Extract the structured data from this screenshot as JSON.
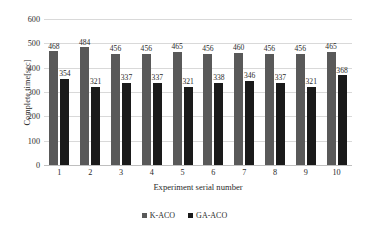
{
  "chart_data": {
    "type": "bar",
    "title": "",
    "xlabel": "Experiment serial number",
    "ylabel": "Complete time[sec]",
    "categories": [
      "1",
      "2",
      "3",
      "4",
      "5",
      "6",
      "7",
      "8",
      "9",
      "10"
    ],
    "series": [
      {
        "name": "K-ACO",
        "color": "#595959",
        "values": [
          468,
          484,
          456,
          456,
          465,
          456,
          460,
          456,
          456,
          465
        ]
      },
      {
        "name": "GA-ACO",
        "color": "#1a1a1a",
        "values": [
          354,
          321,
          337,
          337,
          321,
          338,
          346,
          337,
          321,
          368
        ]
      }
    ],
    "ylim": [
      0,
      600
    ],
    "yticks": [
      0,
      100,
      200,
      300,
      400,
      500,
      600
    ],
    "ytick_labels": [
      "0",
      "100",
      "200",
      "300",
      "400",
      "500",
      "600"
    ],
    "grid": true,
    "legend_position": "bottom",
    "data_labels": true
  }
}
